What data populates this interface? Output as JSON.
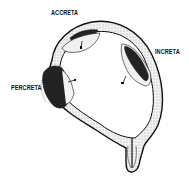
{
  "diagram": {
    "labels": {
      "accreta": "ACCRETA",
      "increta": "INCRETA",
      "percreta": "PERCRETA"
    },
    "colors": {
      "ink": "#111111",
      "background": "#ffffff",
      "placenta_fill": "#2a2a2a",
      "wall_fill": "#e8e8e8"
    }
  }
}
